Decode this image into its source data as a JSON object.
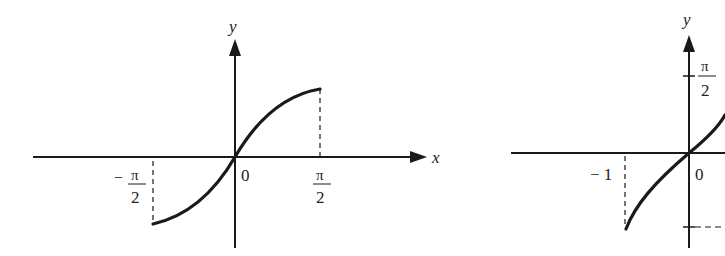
{
  "figures": [
    {
      "id": "left",
      "function": "y = sin x",
      "domain": "[-π/2, π/2]",
      "axis_x_label": "x",
      "axis_y_label": "y",
      "origin_label": "0",
      "x_ticks": [
        {
          "num": "π",
          "den": "2",
          "sign": "−",
          "value": "-π/2"
        },
        {
          "num": "π",
          "den": "2",
          "sign": "",
          "value": "π/2"
        }
      ]
    },
    {
      "id": "right",
      "function": "y = arcsin x",
      "domain": "[-1, 1]",
      "axis_y_label": "y",
      "origin_label": "0",
      "x_ticks": [
        {
          "label": "− 1",
          "value": "-1"
        }
      ],
      "y_ticks": [
        {
          "num": "π",
          "den": "2",
          "value": "π/2"
        },
        {
          "num": "π",
          "den": "2",
          "sign": "−",
          "value": "-π/2"
        }
      ]
    }
  ],
  "labels": {
    "left_x": "x",
    "left_y": "y",
    "left_origin": "0",
    "left_neg_sign": "−",
    "left_pi": "π",
    "left_two": "2",
    "right_y": "y",
    "right_origin": "0",
    "right_neg_one": "− 1",
    "right_pi": "π",
    "right_two": "2",
    "right_neg_dash": "−"
  },
  "colors": {
    "ink": "#1a1a1a",
    "background": "#ffffff"
  }
}
